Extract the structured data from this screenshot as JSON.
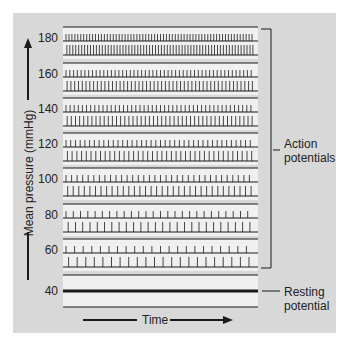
{
  "figure": {
    "y_axis_label": "Mean pressure (mmHg)",
    "x_axis_label": "Time",
    "annotations": {
      "action_potentials": [
        "Action",
        "potentials"
      ],
      "resting_potential": [
        "Resting",
        "potential"
      ]
    },
    "colors": {
      "panel_background": "#d8d8d8",
      "strip_background": "#f0f0f0",
      "ink": "#1a1a1a"
    }
  },
  "chart_data": {
    "type": "table",
    "title": "",
    "xlabel": "Time",
    "ylabel": "Mean pressure (mmHg)",
    "categories": [
      "180",
      "160",
      "140",
      "120",
      "100",
      "80",
      "60",
      "40"
    ],
    "series": [
      {
        "name": "Action potential spikes per trace (approx., across strip width)",
        "values": [
          64,
          50,
          46,
          40,
          34,
          26,
          22,
          0
        ]
      }
    ],
    "strips": [
      {
        "pressure": 180,
        "label": "180",
        "spikes_per_row": 64,
        "type": "action"
      },
      {
        "pressure": 160,
        "label": "160",
        "spikes_per_row": 50,
        "type": "action"
      },
      {
        "pressure": 140,
        "label": "140",
        "spikes_per_row": 46,
        "type": "action"
      },
      {
        "pressure": 120,
        "label": "120",
        "spikes_per_row": 40,
        "type": "action"
      },
      {
        "pressure": 100,
        "label": "100",
        "spikes_per_row": 34,
        "type": "action"
      },
      {
        "pressure": 80,
        "label": "80",
        "spikes_per_row": 26,
        "type": "action"
      },
      {
        "pressure": 60,
        "label": "60",
        "spikes_per_row": 22,
        "type": "action"
      },
      {
        "pressure": 40,
        "label": "40",
        "spikes_per_row": 0,
        "type": "resting"
      }
    ],
    "legend": []
  }
}
